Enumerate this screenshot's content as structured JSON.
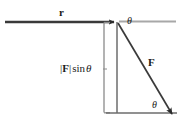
{
  "figure": {
    "width": 184,
    "height": 126,
    "background_color": "#ffffff"
  },
  "labels": {
    "position_vector": "r",
    "force_vector": "F",
    "angle_top": "θ",
    "angle_bottom": "θ",
    "perpendicular_component": {
      "bar_open": "|",
      "vector": "F",
      "bar_close": "|",
      "function": "sin",
      "angle": "θ",
      "full": "|F| sin θ"
    }
  },
  "colors": {
    "stroke_dark": "#2b2b2b",
    "stroke_mid": "#555555",
    "stroke_light": "#9a9a9a",
    "text": "#1a1a1a",
    "background": "#ffffff"
  },
  "geometry": {
    "vertex": {
      "x": 117,
      "y": 22
    },
    "r_arrow": {
      "x1": 5,
      "y1": 22,
      "x2": 117,
      "y2": 22
    },
    "baseline_extension": {
      "x1": 119,
      "y1": 22,
      "x2": 176,
      "y2": 22
    },
    "F_arrow": {
      "x1": 117,
      "y1": 22,
      "x2": 176,
      "y2": 119
    },
    "vertical_drop": {
      "x1": 117,
      "y1": 22,
      "x2": 117,
      "y2": 113
    },
    "bottom_horizontal": {
      "x1": 104,
      "y1": 113,
      "x2": 177,
      "y2": 113
    },
    "bracket_vertical": {
      "x1": 104,
      "y1": 22,
      "x2": 104,
      "y2": 113
    }
  }
}
